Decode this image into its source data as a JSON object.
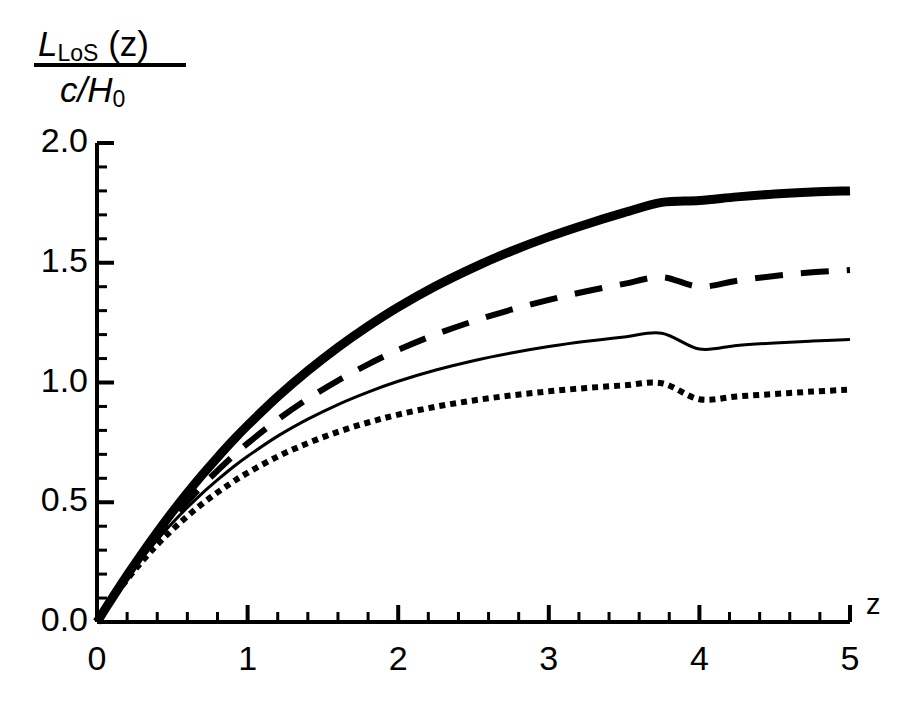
{
  "figure": {
    "background_color": "#ffffff",
    "foreground_color": "#000000"
  },
  "axes": {
    "y_label": {
      "numerator_symbol": "L",
      "numerator_subscript": "LoS",
      "numerator_argument": "(z)",
      "denominator": "c/H",
      "denominator_subscript": "0"
    },
    "x_label": "z",
    "y_ticks": [
      "0.0",
      "0.5",
      "1.0",
      "1.5",
      "2.0"
    ],
    "x_ticks": [
      "0",
      "1",
      "2",
      "3",
      "4",
      "5"
    ]
  },
  "chart_data": {
    "type": "line",
    "title": "",
    "xlabel": "z",
    "ylabel": "L_LoS(z) / (c/H_0)",
    "xlim": [
      0,
      5
    ],
    "ylim": [
      0,
      2.0
    ],
    "grid": false,
    "legend": "none",
    "x_major_ticks": [
      0,
      1,
      2,
      3,
      4,
      5
    ],
    "y_major_ticks": [
      0.0,
      0.5,
      1.0,
      1.5,
      2.0
    ],
    "x_minor_tick_step": 0.2,
    "y_minor_tick_step": 0.1,
    "x": [
      0,
      0.1,
      0.2,
      0.3,
      0.4,
      0.5,
      0.6,
      0.7,
      0.8,
      0.9,
      1.0,
      1.2,
      1.4,
      1.6,
      1.8,
      2.0,
      2.25,
      2.5,
      2.75,
      3.0,
      3.25,
      3.5,
      3.75,
      4.0,
      4.25,
      4.5,
      4.75,
      5.0
    ],
    "series": [
      {
        "name": "thick-solid-curve",
        "style": "solid",
        "line_width": 9,
        "color": "#000000",
        "values": [
          0.0,
          0.099,
          0.195,
          0.287,
          0.375,
          0.459,
          0.539,
          0.615,
          0.687,
          0.756,
          0.821,
          0.941,
          1.049,
          1.147,
          1.235,
          1.315,
          1.403,
          1.48,
          1.548,
          1.608,
          1.661,
          1.709,
          1.752,
          1.76,
          1.775,
          1.787,
          1.795,
          1.8
        ]
      },
      {
        "name": "dashed-curve",
        "style": "dashed",
        "line_width": 6,
        "color": "#000000",
        "dash_pattern": [
          28,
          18
        ],
        "values": [
          0.0,
          0.097,
          0.189,
          0.275,
          0.356,
          0.432,
          0.503,
          0.57,
          0.632,
          0.691,
          0.746,
          0.845,
          0.932,
          1.008,
          1.076,
          1.136,
          1.201,
          1.256,
          1.304,
          1.345,
          1.381,
          1.412,
          1.44,
          1.4,
          1.425,
          1.445,
          1.46,
          1.47
        ]
      },
      {
        "name": "thin-solid-curve",
        "style": "solid",
        "line_width": 3,
        "color": "#000000",
        "values": [
          0.0,
          0.096,
          0.185,
          0.267,
          0.343,
          0.413,
          0.478,
          0.538,
          0.593,
          0.645,
          0.692,
          0.776,
          0.847,
          0.908,
          0.96,
          1.005,
          1.052,
          1.091,
          1.123,
          1.15,
          1.172,
          1.19,
          1.206,
          1.14,
          1.155,
          1.165,
          1.173,
          1.18
        ]
      },
      {
        "name": "dotted-curve",
        "style": "dotted",
        "line_width": 6,
        "color": "#000000",
        "dash_pattern": [
          6,
          5
        ],
        "values": [
          0.0,
          0.094,
          0.178,
          0.254,
          0.323,
          0.385,
          0.442,
          0.494,
          0.541,
          0.584,
          0.623,
          0.691,
          0.747,
          0.794,
          0.833,
          0.866,
          0.899,
          0.925,
          0.946,
          0.963,
          0.977,
          0.988,
          0.997,
          0.93,
          0.942,
          0.952,
          0.962,
          0.97
        ]
      }
    ]
  }
}
